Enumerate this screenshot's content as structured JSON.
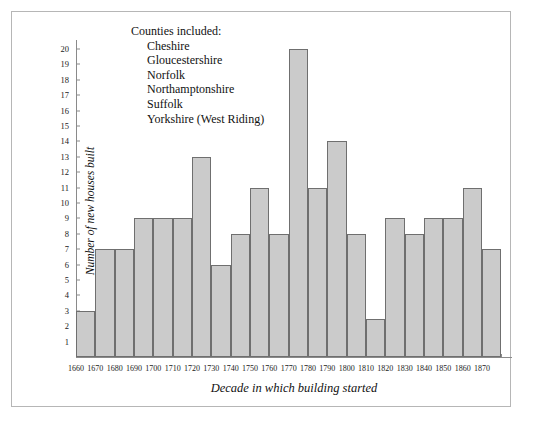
{
  "chart_data": {
    "type": "bar",
    "title": "",
    "subtitle": "",
    "xlabel": "Decade in which building started",
    "ylabel": "Number of new houses built",
    "categories": [
      "1660",
      "1670",
      "1680",
      "1690",
      "1700",
      "1710",
      "1720",
      "1730",
      "1740",
      "1750",
      "1760",
      "1770",
      "1780",
      "1790",
      "1800",
      "1810",
      "1820",
      "1830",
      "1840",
      "1850",
      "1860",
      "1870"
    ],
    "values": [
      3,
      7,
      7,
      9,
      9,
      9,
      13,
      6,
      8,
      11,
      8,
      20,
      11,
      14,
      8,
      2.5,
      9,
      8,
      9,
      9,
      11,
      7
    ],
    "ylim": [
      0,
      20
    ],
    "ytick_labels": [
      "1",
      "2",
      "3",
      "4",
      "5",
      "6",
      "7",
      "8",
      "9",
      "10",
      "11",
      "12",
      "13",
      "14",
      "15",
      "16",
      "17",
      "18",
      "19",
      "20"
    ],
    "ytick_values": [
      1,
      2,
      3,
      4,
      5,
      6,
      7,
      8,
      9,
      10,
      11,
      12,
      13,
      14,
      15,
      16,
      17,
      18,
      19,
      20
    ],
    "grid": false,
    "legend_position": "none",
    "bar_fill_color": "#cbcbcb",
    "bar_edge_color": "#6f6f6f",
    "axis_color": "#8a8a8a",
    "frame_color": "#b6b6b6",
    "background_color": "#ffffff"
  },
  "annotation": {
    "title": "Counties included:",
    "items": [
      "Cheshire",
      "Gloucestershire",
      "Norfolk",
      "Northamptonshire",
      "Suffolk",
      "Yorkshire (West Riding)"
    ]
  }
}
